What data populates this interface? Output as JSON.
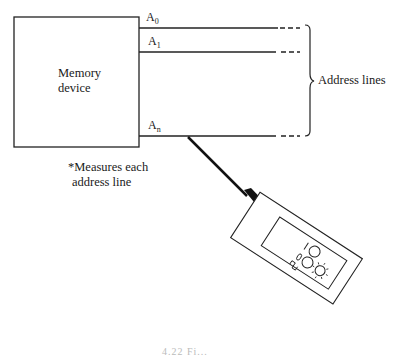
{
  "diagram": {
    "memory_box": {
      "label_line1": "Memory",
      "label_line2": "device"
    },
    "address_lines": [
      {
        "name": "A",
        "subscript": "0"
      },
      {
        "name": "A",
        "subscript": "1"
      },
      {
        "name": "A",
        "subscript": "n"
      }
    ],
    "brace_label": "Address lines",
    "note": {
      "line1": "*Measures each",
      "line2": "address line"
    },
    "probe": {
      "indicator_labels": [
        "1",
        "0",
        "⎍"
      ]
    },
    "caption_fragment": "4.22   Fi..."
  }
}
